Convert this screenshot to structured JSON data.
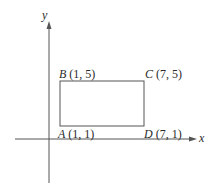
{
  "diagram": {
    "type": "coordinate-plane-rectangle",
    "axes": {
      "x_label": "x",
      "y_label": "y"
    },
    "points": [
      {
        "name": "A",
        "coords": "(1, 1)",
        "x": 1,
        "y": 1
      },
      {
        "name": "B",
        "coords": "(1, 5)",
        "x": 1,
        "y": 5
      },
      {
        "name": "C",
        "coords": "(7, 5)",
        "x": 7,
        "y": 5
      },
      {
        "name": "D",
        "coords": "(7, 1)",
        "x": 7,
        "y": 1
      }
    ],
    "shape": "rectangle ABCD",
    "colors": {
      "line": "#555555",
      "text": "#2a2a2a",
      "background": "#ffffff"
    }
  }
}
